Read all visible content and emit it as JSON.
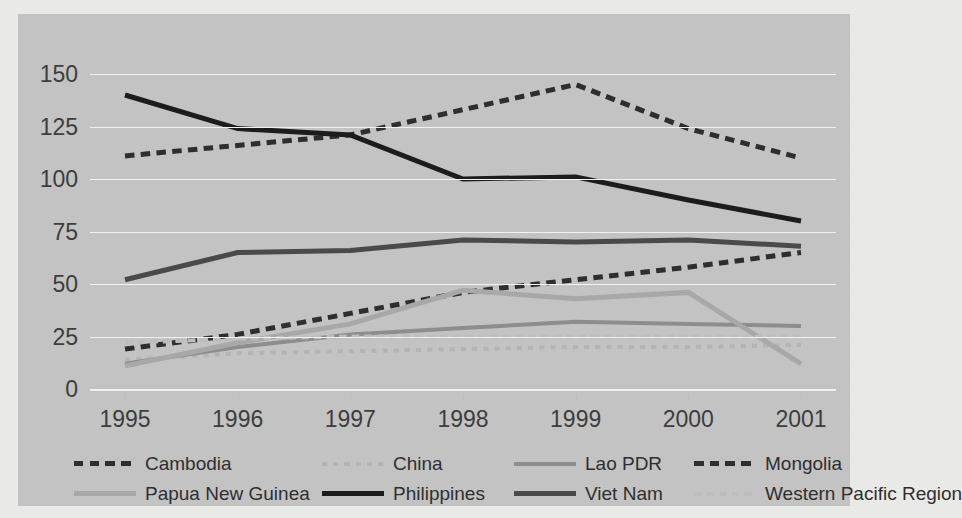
{
  "chart_data": {
    "type": "line",
    "title": "",
    "xlabel": "",
    "ylabel": "",
    "x": [
      "1995",
      "1996",
      "1997",
      "1998",
      "1999",
      "2000",
      "2001"
    ],
    "categories": [
      "1995",
      "1996",
      "1997",
      "1998",
      "1999",
      "2000",
      "2001"
    ],
    "ylim": [
      0,
      160
    ],
    "yticks": [
      0,
      25,
      50,
      75,
      100,
      125,
      150
    ],
    "grid": true,
    "legend_position": "bottom",
    "series": [
      {
        "name": "Cambodia",
        "values": [
          19,
          26,
          36,
          46,
          52,
          58,
          65
        ],
        "color": "#2e2e2e",
        "style": "dashed",
        "width": 5
      },
      {
        "name": "China",
        "values": [
          14,
          17,
          18,
          19,
          20,
          20,
          21
        ],
        "color": "#b4b4b4",
        "style": "fine-dotted",
        "width": 4
      },
      {
        "name": "Lao PDR",
        "values": [
          12,
          20,
          26,
          29,
          32,
          31,
          30
        ],
        "color": "#8d8d8d",
        "style": "solid",
        "width": 4
      },
      {
        "name": "Mongolia",
        "values": [
          111,
          116,
          121,
          133,
          145,
          124,
          110
        ],
        "color": "#2e2e2e",
        "style": "dashed",
        "width": 5
      },
      {
        "name": "Papua New Guinea",
        "values": [
          11,
          22,
          31,
          47,
          43,
          46,
          12
        ],
        "color": "#a8a8a8",
        "style": "solid",
        "width": 5
      },
      {
        "name": "Philippines",
        "values": [
          140,
          124,
          121,
          100,
          101,
          90,
          80
        ],
        "color": "#1c1c1c",
        "style": "solid",
        "width": 5
      },
      {
        "name": "Viet Nam",
        "values": [
          52,
          65,
          66,
          71,
          70,
          71,
          68
        ],
        "color": "#4a4a4a",
        "style": "solid",
        "width": 5
      },
      {
        "name": "Western Pacific Region",
        "values": [
          22,
          24,
          25,
          25,
          25,
          25,
          25
        ],
        "color": "#bdbdbd",
        "style": "dashed",
        "width": 4
      }
    ]
  },
  "legend": {
    "entries": [
      {
        "label": "Cambodia"
      },
      {
        "label": "China"
      },
      {
        "label": "Lao PDR"
      },
      {
        "label": "Mongolia"
      },
      {
        "label": "Papua New Guinea"
      },
      {
        "label": "Philippines"
      },
      {
        "label": "Viet Nam"
      },
      {
        "label": "Western Pacific Region"
      }
    ]
  },
  "colors": {
    "plot_background": "#c3c3c3",
    "page_background": "#e9e9e7",
    "gridline": "#f2f2f2",
    "tick_text": "#3d3d3d"
  }
}
